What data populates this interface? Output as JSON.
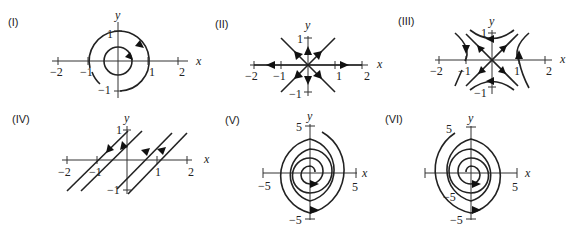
{
  "panels": [
    {
      "id": "I",
      "label": "(I)",
      "type": "phase-portrait",
      "description": "Closed concentric orbits (center), counterclockwise-looking arrows pointing clockwise",
      "x_axis_label": "x",
      "y_axis_label": "y",
      "x_ticks": [
        "−2",
        "−1",
        "1",
        "2"
      ],
      "y_ticks": [
        "1",
        "−1"
      ]
    },
    {
      "id": "II",
      "label": "(II)",
      "type": "phase-portrait",
      "description": "Unstable star node: straight-line trajectories radiating outward from origin",
      "x_axis_label": "x",
      "y_axis_label": "y",
      "x_ticks": [
        "−2",
        "−1",
        "1",
        "2"
      ],
      "y_ticks": [
        "1",
        "−1"
      ]
    },
    {
      "id": "III",
      "label": "(III)",
      "type": "phase-portrait",
      "description": "Saddle point with hyperbolic trajectories",
      "x_axis_label": "x",
      "y_axis_label": "y",
      "x_ticks": [
        "−2",
        "−1",
        "1",
        "2"
      ],
      "y_ticks": [
        "1",
        "−1"
      ]
    },
    {
      "id": "IV",
      "label": "(IV)",
      "type": "phase-portrait",
      "description": "Parallel diagonal line trajectories (degenerate), moving in opposite directions on either side",
      "x_axis_label": "x",
      "y_axis_label": "y",
      "x_ticks": [
        "−2",
        "−1",
        "1",
        "2"
      ],
      "y_ticks": [
        "1",
        "−1"
      ]
    },
    {
      "id": "V",
      "label": "(V)",
      "type": "phase-portrait",
      "description": "Spiral sink (clockwise inward spiral)",
      "x_axis_label": "x",
      "y_axis_label": "y",
      "x_ticks": [
        "−5",
        "5"
      ],
      "y_ticks": [
        "5",
        "−5"
      ]
    },
    {
      "id": "VI",
      "label": "(VI)",
      "type": "phase-portrait",
      "description": "Spiral source (outward spiral)",
      "x_axis_label": "x",
      "y_axis_label": "y",
      "x_ticks": [
        "−5",
        "5"
      ],
      "y_ticks": [
        "5",
        "−5"
      ]
    }
  ]
}
